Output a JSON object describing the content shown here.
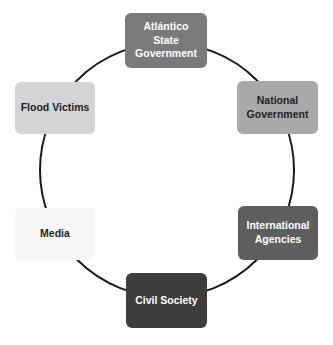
{
  "diagram": {
    "type": "cycle",
    "ring": {
      "cx": 167,
      "cy": 170,
      "r": 127,
      "stroke": "#1a1a1a",
      "stroke_width": 2
    },
    "nodes": [
      {
        "id": "atlantico",
        "label": "Atlántico State Government",
        "lines": [
          "Atlántico",
          "State",
          "Government"
        ],
        "fill": "#7a7a7a",
        "text_color": "#ffffff"
      },
      {
        "id": "national",
        "label": "National Government",
        "lines": [
          "National",
          "Government"
        ],
        "fill": "#a9a9a9",
        "text_color": "#222222"
      },
      {
        "id": "international",
        "label": "International Agencies",
        "lines": [
          "International",
          "Agencies"
        ],
        "fill": "#5e5e5e",
        "text_color": "#ffffff"
      },
      {
        "id": "civil",
        "label": "Civil Society",
        "lines": [
          "Civil Society"
        ],
        "fill": "#3d3d3d",
        "text_color": "#ffffff"
      },
      {
        "id": "media",
        "label": "Media",
        "lines": [
          "Media"
        ],
        "fill": "#f7f7f7",
        "text_color": "#222222"
      },
      {
        "id": "flood",
        "label": "Flood Victims",
        "lines": [
          "Flood Victims"
        ],
        "fill": "#d4d4d4",
        "text_color": "#222222"
      }
    ]
  }
}
